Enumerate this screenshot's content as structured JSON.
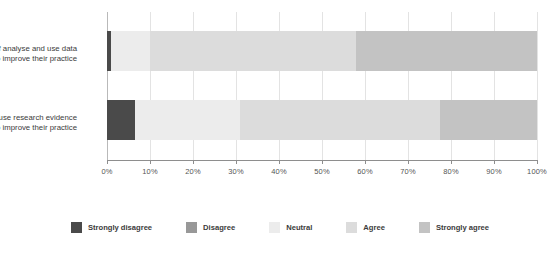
{
  "chart_data": {
    "type": "bar",
    "orientation": "horizontal",
    "stacked": true,
    "stacked_percent": true,
    "title": "",
    "xlabel": "",
    "ylabel": "",
    "xlim": [
      0,
      100
    ],
    "grid": true,
    "legend_position": "bottom",
    "categories": [
      "Staff analyse and use data to improve their practice",
      "Staff use research evidence to improve their practice"
    ],
    "category_lines": [
      [
        "Staff analyse and use data",
        "to improve their practice"
      ],
      [
        "Staff use research evidence",
        "to improve their practice"
      ]
    ],
    "tick_labels": [
      "0%",
      "10%",
      "20%",
      "30%",
      "40%",
      "50%",
      "60%",
      "70%",
      "80%",
      "90%",
      "100%"
    ],
    "tick_values": [
      0,
      10,
      20,
      30,
      40,
      50,
      60,
      70,
      80,
      90,
      100
    ],
    "series": [
      {
        "name": "Strongly disagree",
        "color": "#4a4a4a",
        "values": [
          1,
          6.5
        ]
      },
      {
        "name": "Disagree",
        "color": "#989898",
        "values": [
          0,
          0
        ]
      },
      {
        "name": "Neutral",
        "color": "#ececec",
        "values": [
          9,
          24.5
        ]
      },
      {
        "name": "Agree",
        "color": "#dcdcdc",
        "values": [
          48,
          46.5
        ]
      },
      {
        "name": "Strongly agree",
        "color": "#c3c3c3",
        "values": [
          42,
          22.5
        ]
      }
    ]
  },
  "legend": {
    "items": [
      {
        "label": "Strongly disagree",
        "color": "#4a4a4a"
      },
      {
        "label": "Disagree",
        "color": "#989898"
      },
      {
        "label": "Neutral",
        "color": "#ececec"
      },
      {
        "label": "Agree",
        "color": "#dcdcdc"
      },
      {
        "label": "Strongly agree",
        "color": "#c3c3c3"
      }
    ]
  }
}
